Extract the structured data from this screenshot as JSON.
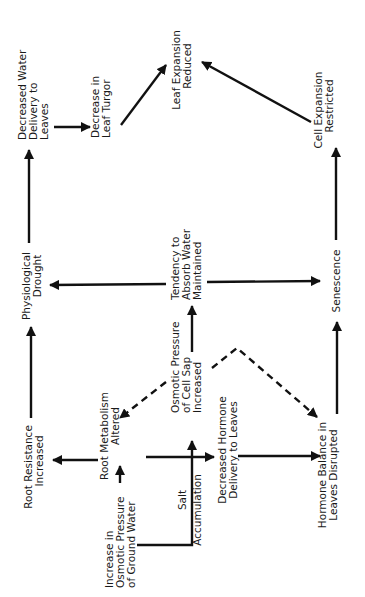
{
  "diagram": {
    "orientation": "rotated-90-ccw",
    "nodes": {
      "decreased_water_delivery": {
        "lines": [
          "Decreased Water",
          "Delivery to",
          "Leaves"
        ]
      },
      "decrease_leaf_turgor": {
        "lines": [
          "Decrease in",
          "Leaf Turgor"
        ]
      },
      "leaf_expansion_reduced": {
        "lines": [
          "Leaf Expansion",
          "Reduced"
        ]
      },
      "cell_expansion_restricted": {
        "lines": [
          "Cell Expansion",
          "Restricted"
        ]
      },
      "physiological_drought": {
        "lines": [
          "Physiological",
          "Drought"
        ]
      },
      "tendency_absorb_water": {
        "lines": [
          "Tendency to",
          "Absorb Water",
          "Maintained"
        ]
      },
      "senescence": {
        "lines": [
          "Senescence"
        ]
      },
      "root_resistance_increased": {
        "lines": [
          "Root Resistance",
          "Increased"
        ]
      },
      "root_metabolism_altered": {
        "lines": [
          "Root Metabolism",
          "Altered"
        ]
      },
      "osmotic_pressure_cell_sap": {
        "lines": [
          "Osmotic Pressure",
          "of Cell Sap",
          "Increased"
        ]
      },
      "decreased_hormone_delivery": {
        "lines": [
          "Decreased Hormone",
          "Delivery to Leaves"
        ]
      },
      "hormone_balance_disrupted": {
        "lines": [
          "Hormone Balance in",
          "Leaves Disrupted"
        ]
      },
      "increase_osmotic_ground_water": {
        "lines": [
          "Increase in",
          "Osmotic Pressure",
          "of Ground Water"
        ]
      },
      "salt_accumulation": {
        "lines": [
          "Salt",
          "Accumulation"
        ]
      }
    },
    "edges": [
      {
        "from": "increase_osmotic_ground_water",
        "to": "root_metabolism_altered",
        "style": "solid"
      },
      {
        "from": "increase_osmotic_ground_water",
        "to": "osmotic_pressure_cell_sap",
        "style": "solid",
        "label": "salt_accumulation"
      },
      {
        "from": "root_metabolism_altered",
        "to": "root_resistance_increased",
        "style": "solid"
      },
      {
        "from": "root_metabolism_altered",
        "to": "decreased_hormone_delivery",
        "style": "solid"
      },
      {
        "from": "decreased_hormone_delivery",
        "to": "hormone_balance_disrupted",
        "style": "solid"
      },
      {
        "from": "osmotic_pressure_cell_sap",
        "to": "root_metabolism_altered",
        "style": "dashed"
      },
      {
        "from": "osmotic_pressure_cell_sap",
        "to": "hormone_balance_disrupted",
        "style": "dashed"
      },
      {
        "from": "osmotic_pressure_cell_sap",
        "to": "tendency_absorb_water",
        "style": "solid"
      },
      {
        "from": "root_resistance_increased",
        "to": "physiological_drought",
        "style": "solid"
      },
      {
        "from": "tendency_absorb_water",
        "to": "physiological_drought",
        "style": "solid"
      },
      {
        "from": "tendency_absorb_water",
        "to": "senescence",
        "style": "solid"
      },
      {
        "from": "hormone_balance_disrupted",
        "to": "senescence",
        "style": "solid"
      },
      {
        "from": "physiological_drought",
        "to": "decreased_water_delivery",
        "style": "solid"
      },
      {
        "from": "decreased_water_delivery",
        "to": "decrease_leaf_turgor",
        "style": "solid"
      },
      {
        "from": "decrease_leaf_turgor",
        "to": "leaf_expansion_reduced",
        "style": "solid"
      },
      {
        "from": "senescence",
        "to": "cell_expansion_restricted",
        "style": "solid"
      },
      {
        "from": "cell_expansion_restricted",
        "to": "leaf_expansion_reduced",
        "style": "solid"
      }
    ]
  }
}
